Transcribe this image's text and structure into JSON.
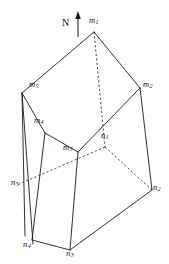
{
  "figure": {
    "kind": "3d-polyhedron-line-drawing",
    "width": 169,
    "height": 264,
    "background_color": "#ffffff",
    "line_color": "#1a1a1a",
    "hidden_line_color": "#2a2a2a"
  },
  "compass": {
    "label": "N",
    "direction": "up",
    "icon": "north-arrow-icon",
    "label_x": 62,
    "label_y": 22,
    "shaft_x": 78,
    "shaft_top_y": 14,
    "shaft_bottom_y": 36
  },
  "vertices": {
    "top_face": [
      {
        "id": "m1",
        "base": "m",
        "sub": "1",
        "x": 94,
        "y": 32,
        "label_x": 89,
        "label_y": 20,
        "hidden": false
      },
      {
        "id": "m2",
        "base": "m",
        "sub": "2",
        "x": 140,
        "y": 88,
        "label_x": 143,
        "label_y": 84,
        "hidden": false
      },
      {
        "id": "m3",
        "base": "m",
        "sub": "3",
        "x": 78,
        "y": 152,
        "label_x": 63,
        "label_y": 147,
        "hidden": false
      },
      {
        "id": "m4",
        "base": "m",
        "sub": "4",
        "x": 45,
        "y": 133,
        "label_x": 34,
        "label_y": 120,
        "hidden": false
      },
      {
        "id": "m5",
        "base": "m",
        "sub": "5",
        "x": 22,
        "y": 93,
        "label_x": 29,
        "label_y": 84,
        "hidden": false
      }
    ],
    "bottom_face": [
      {
        "id": "n1",
        "base": "n",
        "sub": "1",
        "x": 105,
        "y": 147,
        "label_x": 101,
        "label_y": 136,
        "hidden": true
      },
      {
        "id": "n2",
        "base": "n",
        "sub": "2",
        "x": 152,
        "y": 190,
        "label_x": 152,
        "label_y": 186,
        "hidden": false
      },
      {
        "id": "n3",
        "base": "n",
        "sub": "3",
        "x": 70,
        "y": 250,
        "label_x": 65,
        "label_y": 249,
        "hidden": false
      },
      {
        "id": "n4",
        "base": "n",
        "sub": "4",
        "x": 32,
        "y": 240,
        "label_x": 23,
        "label_y": 238,
        "hidden": false
      },
      {
        "id": "n5",
        "base": "n",
        "sub": "5",
        "x": 17,
        "y": 185,
        "label_x": 12,
        "label_y": 181,
        "hidden": false
      }
    ]
  },
  "edges": {
    "solid": [
      {
        "name": "m1-m2",
        "from": [
          94,
          32
        ],
        "to": [
          140,
          88
        ]
      },
      {
        "name": "m1-m5",
        "from": [
          94,
          32
        ],
        "to": [
          22,
          93
        ]
      },
      {
        "name": "m2-m3",
        "from": [
          140,
          88
        ],
        "to": [
          78,
          152
        ]
      },
      {
        "name": "m3-m4",
        "from": [
          78,
          152
        ],
        "to": [
          45,
          133
        ]
      },
      {
        "name": "m4-m5",
        "from": [
          45,
          133
        ],
        "to": [
          22,
          93
        ]
      },
      {
        "name": "m5-n5-left-front",
        "from": [
          22,
          93
        ],
        "to": [
          25,
          236
        ]
      },
      {
        "name": "m5-n5-left-back",
        "from": [
          22,
          93
        ],
        "to": [
          33,
          244
        ]
      },
      {
        "name": "m4-n4",
        "from": [
          45,
          133
        ],
        "to": [
          32,
          240
        ]
      },
      {
        "name": "m3-n3",
        "from": [
          78,
          152
        ],
        "to": [
          70,
          250
        ]
      },
      {
        "name": "m2-n2",
        "from": [
          140,
          88
        ],
        "to": [
          152,
          190
        ]
      },
      {
        "name": "n4-n3",
        "from": [
          32,
          240
        ],
        "to": [
          70,
          250
        ]
      },
      {
        "name": "n3-n2",
        "from": [
          70,
          250
        ],
        "to": [
          152,
          190
        ]
      }
    ],
    "hidden": [
      {
        "name": "m1-n1",
        "from": [
          94,
          32
        ],
        "to": [
          105,
          147
        ]
      },
      {
        "name": "n1-n2",
        "from": [
          105,
          147
        ],
        "to": [
          152,
          190
        ]
      },
      {
        "name": "n1-n5",
        "from": [
          105,
          147
        ],
        "to": [
          17,
          185
        ]
      }
    ]
  }
}
